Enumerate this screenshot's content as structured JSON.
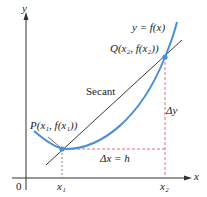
{
  "diagram": {
    "axes": {
      "x_label": "x",
      "y_label": "y",
      "origin_label": "0"
    },
    "curve_label": "y = f(x)",
    "secant_label": "Secant",
    "point_p": "P(x₁, f(x₁))",
    "point_q": "Q(x₂, f(x₂))",
    "x1_label": "x₁",
    "x2_label": "x₂",
    "dx_label": "Δx = h",
    "dy_label": "Δy",
    "colors": {
      "curve": "#4a90d9",
      "secant": "#222222",
      "dashed": "#e06070",
      "axes": "#333333",
      "point": "#4a90d9"
    }
  }
}
